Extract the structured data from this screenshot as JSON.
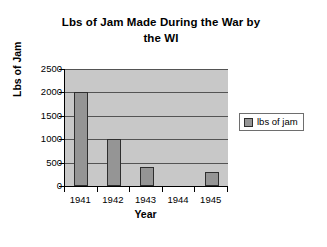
{
  "chart_data": {
    "type": "bar",
    "title": "Lbs of Jam Made During the War by the WI",
    "title_line1": "Lbs of Jam Made During the War by",
    "title_line2": "the WI",
    "xlabel": "Year",
    "ylabel": "Lbs of Jam",
    "categories": [
      "1941",
      "1942",
      "1943",
      "1944",
      "1945"
    ],
    "values": [
      2000,
      1000,
      400,
      0,
      300
    ],
    "series": [
      {
        "name": "lbs of jam",
        "values": [
          2000,
          1000,
          400,
          0,
          300
        ]
      }
    ],
    "ylim": [
      0,
      2500
    ],
    "ytick_values": [
      2500,
      2000,
      1500,
      1000,
      500,
      0
    ],
    "ytick_labels": [
      "2500",
      "2000",
      "1500",
      "1000",
      "500",
      "0"
    ],
    "grid": true,
    "grid_axis": "y",
    "legend": [
      "lbs of jam"
    ],
    "legend_position": "right",
    "colors": {
      "bar_fill": "#959595",
      "bar_border": "#2e2e2e",
      "plot_background": "#c8c8c8",
      "gridline": "#545454",
      "axis": "#000000",
      "text": "#000000",
      "page_background": "#ffffff"
    }
  }
}
